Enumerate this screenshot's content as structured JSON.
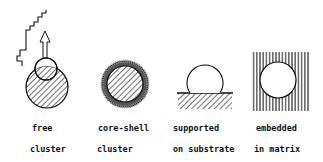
{
  "panels": [
    {
      "id": "free",
      "line1": "free",
      "line2": "cluster"
    },
    {
      "id": "core-shell",
      "line1": "core-shell",
      "line2": "cluster"
    },
    {
      "id": "supported",
      "line1": "supported",
      "line2": "on substrate"
    },
    {
      "id": "embedded",
      "line1": "embedded",
      "line2": "in matrix"
    }
  ],
  "colors": {
    "ink": "#111111",
    "background": "#ffffff"
  }
}
